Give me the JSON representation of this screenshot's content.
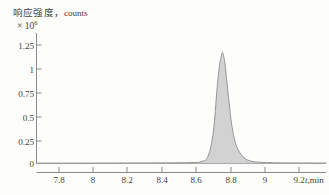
{
  "figure": {
    "background_color": "#fdfdfb",
    "axis_color": "#8a8a8a",
    "text_color": "#3f3f3f",
    "peak_fill_color": "#d0d0d0",
    "peak_line_color": "#8c8c8c"
  },
  "axis": {
    "y_label_cn": "响应强度",
    "y_label_sep": "，",
    "y_label_units": "counts",
    "y_multiplier_base": "× 10",
    "y_multiplier_exponent": "6",
    "x_title_var": "t",
    "x_title_unit": ",min"
  },
  "chart_data": {
    "type": "area",
    "title": "",
    "subtitle": "",
    "xlabel": "t,min",
    "ylabel": "响应强度，counts",
    "y_scale_note": "× 10^6",
    "grid": false,
    "legend": "none",
    "xlim": [
      7.68,
      9.3
    ],
    "ylim": [
      0,
      1.34
    ],
    "xticks": [
      7.8,
      8.0,
      8.2,
      8.4,
      8.6,
      8.8,
      9.0,
      9.2
    ],
    "xtick_labels": [
      "7.8",
      "8",
      "8.2",
      "8.4",
      "8.6",
      "8.8",
      "9",
      "9.2"
    ],
    "yticks": [
      0,
      0.25,
      0.5,
      0.75,
      1,
      1.25
    ],
    "ytick_labels": [
      "0",
      "0.25",
      "0.5",
      "0.75",
      "1",
      "1.25"
    ],
    "series": [
      {
        "name": "chromatogram",
        "peak_apex_x": 8.72,
        "peak_apex_y": 1.14,
        "peak_start_x": 8.59,
        "peak_end_x": 8.92,
        "baseline_y": 0,
        "x": [
          7.68,
          7.9,
          8.1,
          8.3,
          8.45,
          8.55,
          8.6,
          8.64,
          8.67,
          8.69,
          8.705,
          8.715,
          8.72,
          8.725,
          8.735,
          8.75,
          8.77,
          8.79,
          8.81,
          8.84,
          8.87,
          8.9,
          8.94,
          9.0,
          9.1,
          9.3
        ],
        "y": [
          0.004,
          0.004,
          0.005,
          0.006,
          0.007,
          0.01,
          0.018,
          0.075,
          0.33,
          0.76,
          1.02,
          1.11,
          1.14,
          1.12,
          1.02,
          0.76,
          0.43,
          0.235,
          0.135,
          0.062,
          0.03,
          0.018,
          0.012,
          0.008,
          0.006,
          0.005
        ]
      }
    ]
  }
}
